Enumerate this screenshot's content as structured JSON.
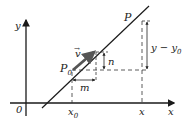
{
  "diagram": {
    "colors": {
      "line": "#1a1a1a",
      "vector": "#555555",
      "dashed": "#333333",
      "background": "#ffffff"
    },
    "labels": {
      "y_axis": "y",
      "x_axis": "x",
      "origin": "0",
      "P": "P",
      "P0": "P",
      "P0_sub": "0",
      "v": "v",
      "v_arrow": "→",
      "n": "n",
      "m": "m",
      "y_minus": "y − y",
      "y_minus_sub": "0",
      "x0": "x",
      "x0_sub": "0",
      "x": "x"
    }
  }
}
